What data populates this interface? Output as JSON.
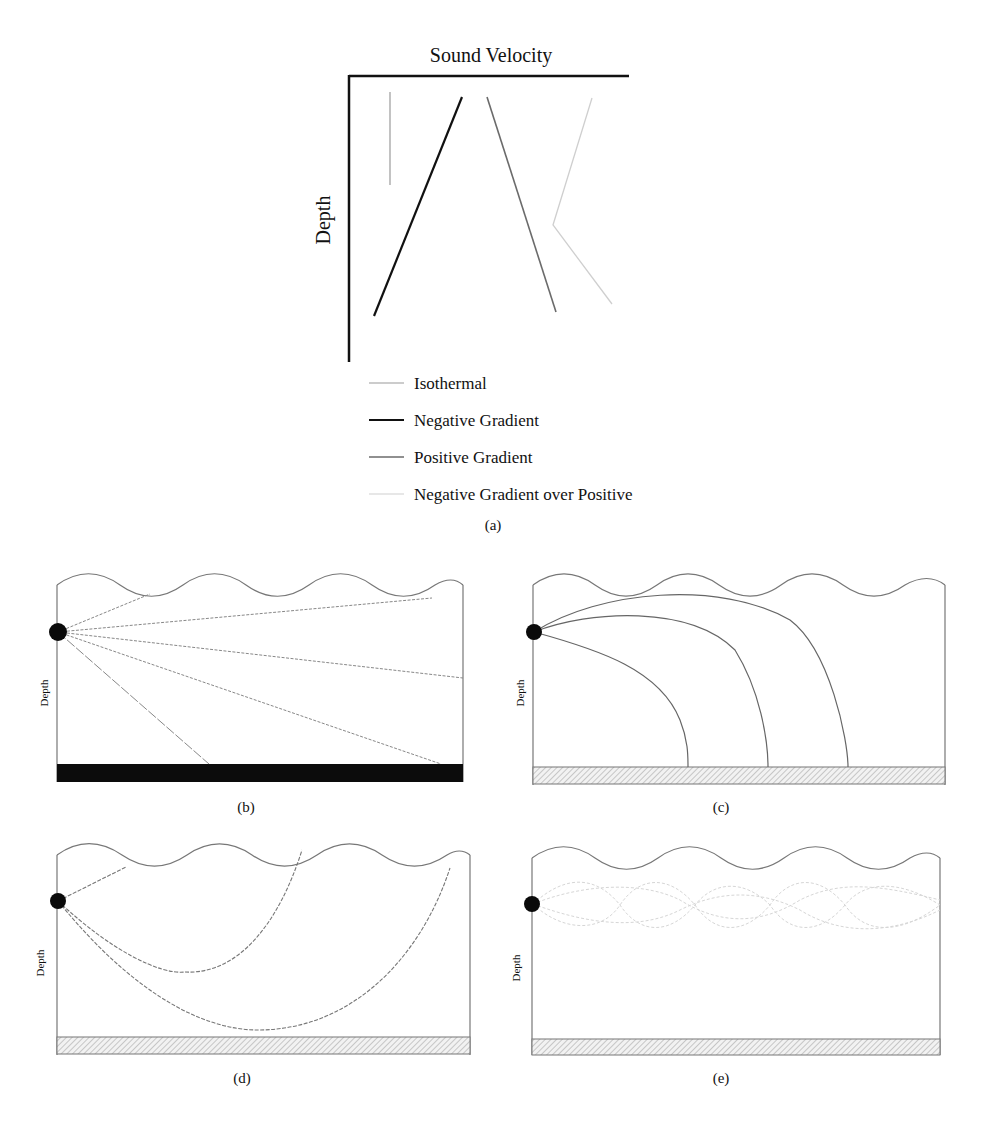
{
  "panel_a": {
    "x_axis_label": "Sound Velocity",
    "y_axis_label": "Depth",
    "caption": "(a)",
    "legend": [
      {
        "label": "Isothermal",
        "color": "#9a9a9a",
        "width": 1
      },
      {
        "label": "Negative Gradient",
        "color": "#111111",
        "width": 2
      },
      {
        "label": "Positive Gradient",
        "color": "#6b6b6b",
        "width": 1.5
      },
      {
        "label": "Negative Gradient over Positive",
        "color": "#cfcfcf",
        "width": 1
      }
    ]
  },
  "panel_b": {
    "caption": "(b)",
    "y_axis_label": "Depth",
    "seafloor": "solid-black"
  },
  "panel_c": {
    "caption": "(c)",
    "y_axis_label": "Depth",
    "seafloor": "hatched"
  },
  "panel_d": {
    "caption": "(d)",
    "y_axis_label": "Depth",
    "seafloor": "hatched"
  },
  "panel_e": {
    "caption": "(e)",
    "y_axis_label": "Depth",
    "seafloor": "hatched"
  }
}
